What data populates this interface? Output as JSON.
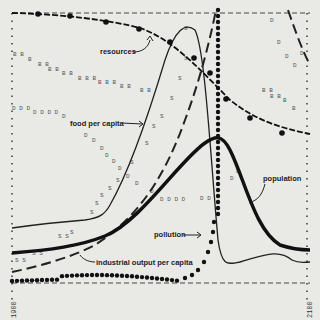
{
  "chart_data": {
    "type": "line",
    "title": "",
    "xlabel": "",
    "ylabel": "",
    "x_range": [
      1900,
      2100
    ],
    "x_tick_labels": [
      "1900",
      "2100"
    ],
    "grid": false,
    "legend_position": "inline annotations",
    "x": [
      1900,
      1920,
      1940,
      1960,
      1970,
      1980,
      1990,
      2000,
      2010,
      2020,
      2030,
      2040,
      2060,
      2080,
      2100
    ],
    "series": [
      {
        "name": "resources",
        "style": "line with large dots",
        "values": [
          1.0,
          0.99,
          0.97,
          0.93,
          0.9,
          0.85,
          0.8,
          0.72,
          0.6,
          0.5,
          0.42,
          0.36,
          0.3,
          0.26,
          0.24
        ]
      },
      {
        "name": "food per capita",
        "style": "thin line",
        "values": [
          0.2,
          0.22,
          0.23,
          0.27,
          0.4,
          0.62,
          0.84,
          0.93,
          0.5,
          0.22,
          0.2,
          0.22,
          0.24,
          0.2,
          0.18
        ]
      },
      {
        "name": "industrial output per capita",
        "style": "dashed line",
        "values": [
          0.08,
          0.12,
          0.17,
          0.28,
          0.38,
          0.55,
          0.75,
          1.0,
          1.0,
          0.95,
          0.8,
          0.6,
          0.4,
          0.28,
          0.2
        ]
      },
      {
        "name": "population",
        "style": "thick line",
        "values": [
          0.13,
          0.15,
          0.17,
          0.24,
          0.3,
          0.37,
          0.46,
          0.54,
          0.56,
          0.5,
          0.35,
          0.24,
          0.15,
          0.12,
          0.1
        ]
      },
      {
        "name": "pollution",
        "style": "dotted line (large dots)",
        "values": [
          0.04,
          0.05,
          0.06,
          0.07,
          0.07,
          0.08,
          0.1,
          0.15,
          0.3,
          1.0,
          1.0,
          1.0,
          0.9,
          0.75,
          0.6
        ]
      },
      {
        "name": "birth rate (B)",
        "style": "letter markers",
        "values": [
          0.63,
          0.6,
          0.57,
          0.54,
          0.52,
          0.5,
          0.48,
          0.5,
          0.56,
          0.55,
          0.5,
          0.47,
          0.42,
          0.37,
          0.35
        ]
      },
      {
        "name": "death rate (D)",
        "style": "letter markers",
        "values": [
          0.45,
          0.44,
          0.4,
          0.3,
          0.22,
          0.17,
          0.12,
          0.1,
          0.33,
          0.55,
          0.58,
          0.6,
          0.8,
          0.88,
          0.95
        ]
      },
      {
        "name": "services per capita (S)",
        "style": "letter markers",
        "values": [
          0.1,
          0.13,
          0.17,
          0.28,
          0.4,
          0.55,
          0.7,
          0.85,
          0.6,
          0.3,
          0.2,
          0.18,
          0.17,
          0.16,
          0.15
        ]
      }
    ],
    "annotations": [
      "resources",
      "food per capita",
      "population",
      "pollution",
      "industrial output per capita"
    ]
  },
  "labels": {
    "resources": "resources",
    "food": "food per capita",
    "population": "population",
    "pollution": "pollution",
    "industrial": "industrial output per capita",
    "x_start": "1900",
    "x_end": "2100"
  }
}
